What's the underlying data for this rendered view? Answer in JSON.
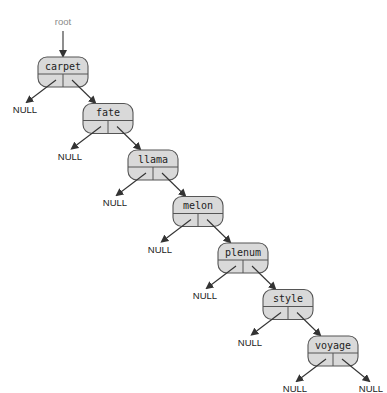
{
  "diagram": {
    "type": "binary-search-tree (right-skewed linked list)",
    "root_label": "root",
    "null_label": "NULL",
    "colors": {
      "node_fill": "#d9d9d9",
      "stroke": "#555555",
      "root_arrow": "#555555"
    },
    "nodes": [
      {
        "label": "carpet",
        "left": "NULL",
        "right": "fate"
      },
      {
        "label": "fate",
        "left": "NULL",
        "right": "llama"
      },
      {
        "label": "llama",
        "left": "NULL",
        "right": "melon"
      },
      {
        "label": "melon",
        "left": "NULL",
        "right": "plenum"
      },
      {
        "label": "plenum",
        "left": "NULL",
        "right": "style"
      },
      {
        "label": "style",
        "left": "NULL",
        "right": "voyage"
      },
      {
        "label": "voyage",
        "left": "NULL",
        "right": "NULL"
      }
    ]
  }
}
